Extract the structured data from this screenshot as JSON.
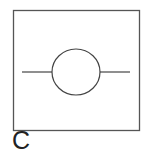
{
  "figure": {
    "label": "C",
    "symbol": "circle-with-line-through-leads",
    "colors": {
      "stroke": "#444444",
      "frame": "#555555",
      "background": "#ffffff"
    }
  }
}
